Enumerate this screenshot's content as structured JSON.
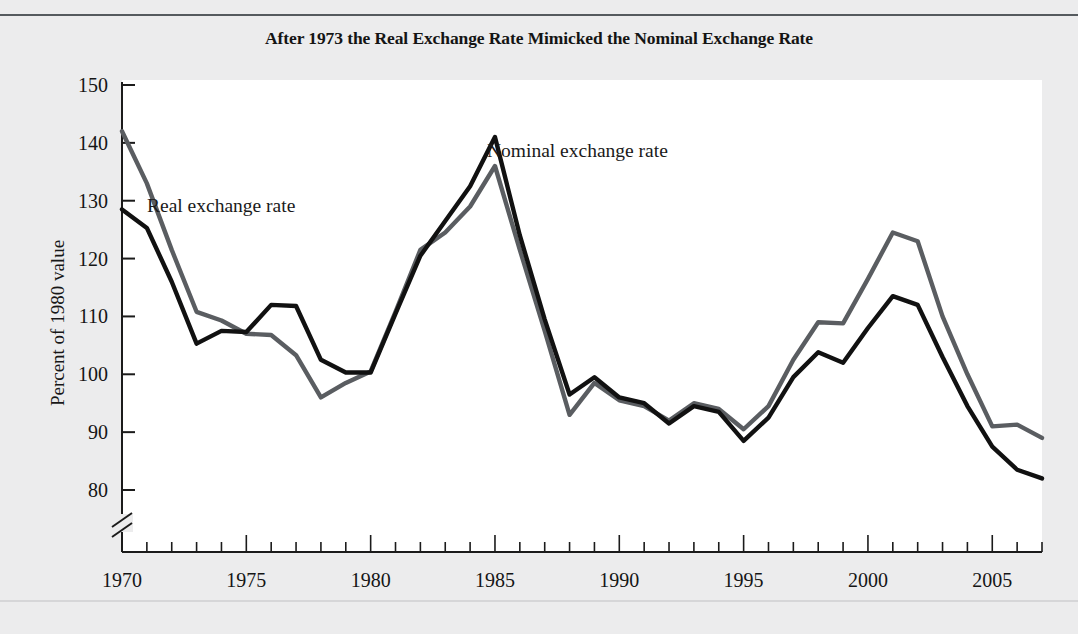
{
  "figure": {
    "title": "After 1973 the Real Exchange Rate Mimicked the Nominal Exchange Rate",
    "ylabel": "Percent of 1980 value",
    "axis_break": true
  },
  "annotations": {
    "real_label": "Real exchange rate",
    "nominal_label": "Nominal exchange rate"
  },
  "colors": {
    "real_series": "#111111",
    "nominal_series": "#5a5d61",
    "axis": "#1b1b1b",
    "plot_background": "#ffffff",
    "figure_background": "#ececed",
    "title_text": "#141414"
  },
  "chart_data": {
    "type": "line",
    "title": "After 1973 the Real Exchange Rate Mimicked the Nominal Exchange Rate",
    "xlabel": "",
    "ylabel": "Percent of 1980 value",
    "xlim": [
      1970,
      2007
    ],
    "ylim": [
      80,
      150
    ],
    "yticks": [
      80,
      90,
      100,
      110,
      120,
      130,
      140,
      150
    ],
    "xticks": [
      1970,
      1975,
      1980,
      1985,
      1990,
      1995,
      2000,
      2005
    ],
    "xtick_minor_step": 1,
    "grid": false,
    "legend": "inline-annotations",
    "x": [
      1970,
      1971,
      1972,
      1973,
      1974,
      1975,
      1976,
      1977,
      1978,
      1979,
      1980,
      1981,
      1982,
      1983,
      1984,
      1985,
      1986,
      1987,
      1988,
      1989,
      1990,
      1991,
      1992,
      1993,
      1994,
      1995,
      1996,
      1997,
      1998,
      1999,
      2000,
      2001,
      2002,
      2003,
      2004,
      2005,
      2006,
      2007
    ],
    "series": [
      {
        "name": "Real exchange rate",
        "color": "#111111",
        "values": [
          128.5,
          125.3,
          116.0,
          105.3,
          107.5,
          107.3,
          112.0,
          111.8,
          102.5,
          100.3,
          100.3,
          110.5,
          120.5,
          126.5,
          132.5,
          141.0,
          124.0,
          109.5,
          96.5,
          99.5,
          96.0,
          95.0,
          91.5,
          94.5,
          93.5,
          88.5,
          92.5,
          99.5,
          103.8,
          102.0,
          108.0,
          113.5,
          112.0,
          103.0,
          94.5,
          87.5,
          83.5,
          82.0
        ]
      },
      {
        "name": "Nominal exchange rate",
        "color": "#5a5d61",
        "values": [
          142.0,
          133.0,
          121.5,
          110.8,
          109.3,
          107.0,
          106.8,
          103.3,
          96.0,
          98.5,
          100.5,
          110.8,
          121.5,
          124.5,
          129.0,
          136.0,
          121.5,
          107.5,
          93.0,
          98.5,
          95.5,
          94.5,
          92.0,
          95.0,
          94.0,
          90.5,
          94.5,
          102.5,
          109.0,
          108.8,
          116.5,
          124.5,
          123.0,
          110.0,
          100.0,
          91.0,
          91.3,
          89.0
        ]
      }
    ]
  }
}
